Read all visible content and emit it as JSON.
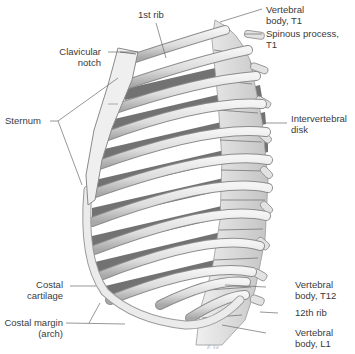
{
  "figure": {
    "signature": "illegible artist signature"
  },
  "labels": {
    "first_rib": "1st rib",
    "vertebral_body_t1": [
      "Vertebral",
      "body, T1"
    ],
    "spinous_process_t1": [
      "Spinous process,",
      "T1"
    ],
    "clavicular_notch": [
      "Clavicular",
      "notch"
    ],
    "sternum": "Sternum",
    "intervertebral_disk": [
      "Intervertebral",
      "disk"
    ],
    "costal_cartilage": [
      "Costal",
      "cartilage"
    ],
    "vertebral_body_t12": [
      "Vertebral",
      "body, T12"
    ],
    "twelfth_rib": "12th rib",
    "costal_margin": [
      "Costal margin",
      "(arch)"
    ],
    "vertebral_body_l1": [
      "Vertebral",
      "body, L1"
    ]
  },
  "colors": {
    "background": "#ffffff",
    "bone_light": "#ededed",
    "bone_mid": "#cfcfcf",
    "bone_shadow": "#4a4a4a",
    "leader_line": "#6a6a6a",
    "text": "#3a3a3a"
  }
}
